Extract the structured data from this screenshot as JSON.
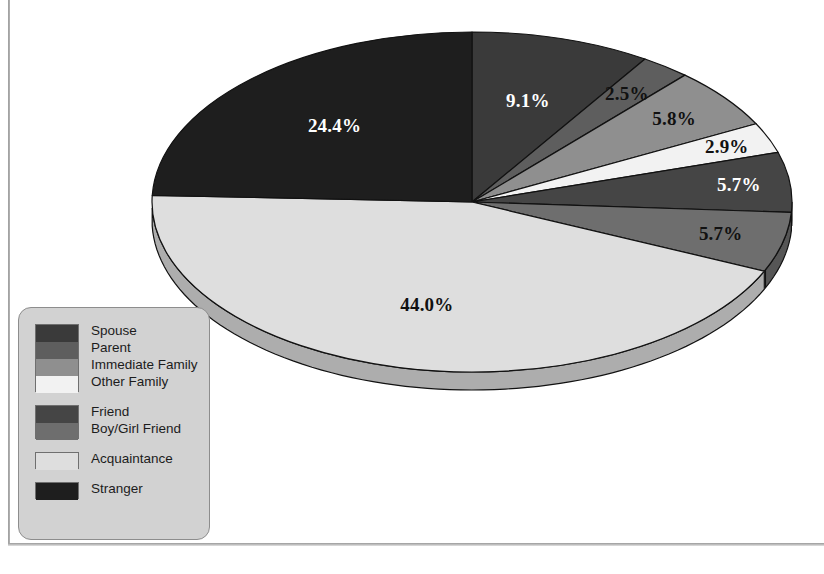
{
  "chart_data": {
    "type": "pie",
    "title": "",
    "subtitle": "",
    "xlabel": "",
    "ylabel": "",
    "legend_position": "bottom-left",
    "grid": false,
    "start_angle_deg": 0,
    "direction": "clockwise",
    "three_d": true,
    "categories": [
      "Spouse",
      "Parent",
      "Immediate Family",
      "Other Family",
      "Friend",
      "Boy/Girl Friend",
      "Acquaintance",
      "Stranger"
    ],
    "values": [
      9.1,
      2.5,
      5.8,
      2.9,
      5.7,
      5.7,
      44.0,
      24.4
    ],
    "value_labels": [
      "9.1%",
      "2.5%",
      "5.8%",
      "2.9%",
      "5.7%",
      "5.7%",
      "44.0%",
      "24.4%"
    ],
    "colors": [
      "#3a3a3a",
      "#5e5e5e",
      "#8f8f8f",
      "#f2f2f2",
      "#454545",
      "#6e6e6e",
      "#dedede",
      "#1e1e1e"
    ],
    "label_text_colors": [
      "light",
      "dark",
      "dark",
      "dark",
      "light",
      "dark",
      "dark",
      "light"
    ],
    "units": "percent",
    "total": 100.1
  },
  "legend": {
    "groups": [
      {
        "items": [
          {
            "label": "Spouse",
            "color": "#3a3a3a"
          },
          {
            "label": "Parent",
            "color": "#5e5e5e"
          },
          {
            "label": "Immediate Family",
            "color": "#8f8f8f"
          },
          {
            "label": "Other Family",
            "color": "#f2f2f2"
          }
        ]
      },
      {
        "items": [
          {
            "label": "Friend",
            "color": "#454545"
          },
          {
            "label": "Boy/Girl Friend",
            "color": "#6e6e6e"
          }
        ]
      },
      {
        "items": [
          {
            "label": "Acquaintance",
            "color": "#dedede"
          }
        ]
      },
      {
        "items": [
          {
            "label": "Stranger",
            "color": "#1e1e1e"
          }
        ]
      }
    ]
  },
  "style": {
    "page_background": "#ffffff",
    "legend_background": "#d2d2d2",
    "legend_border": "#8d8d8d",
    "outline": "#111111"
  }
}
